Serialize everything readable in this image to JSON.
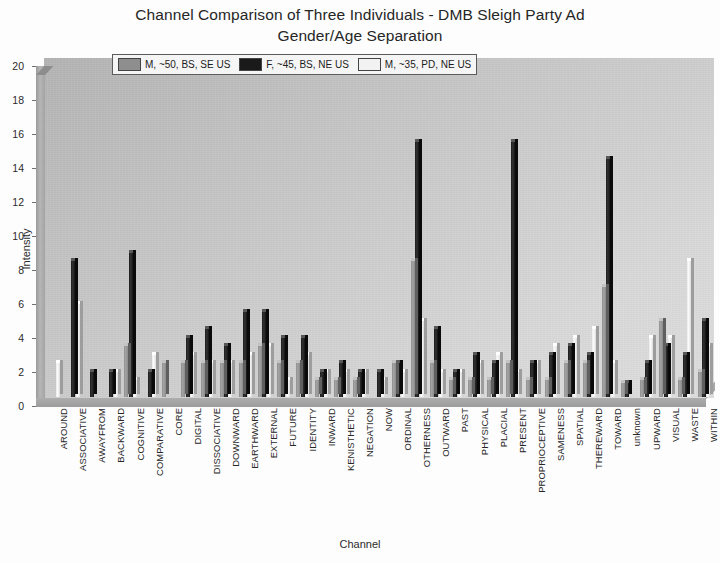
{
  "chart_data": {
    "type": "bar",
    "title": "Channel Comparison of Three Individuals - DMB Sleigh Party Ad\nGender/Age Separation",
    "title_line1": "Channel Comparison of Three Individuals - DMB Sleigh Party Ad",
    "title_line2": "Gender/Age Separation",
    "xlabel": "Channel",
    "ylabel": "Intensity",
    "ylim": [
      0,
      20
    ],
    "ytick_labels": [
      "0",
      "2",
      "4",
      "6",
      "8",
      "10",
      "12",
      "14",
      "16",
      "18",
      "20"
    ],
    "ytick_values": [
      0,
      2,
      4,
      6,
      8,
      10,
      12,
      14,
      16,
      18,
      20
    ],
    "grid": false,
    "legend_position": "top-center",
    "colors": {
      "series_0": "#8e8e8e",
      "series_1": "#1a1a1a",
      "series_2": "#efefef",
      "plot_background": "#cfcfcf",
      "page_background": "#fdfdfd",
      "text": "#262626"
    },
    "categories": [
      "AROUND",
      "ASSOCIATIVE",
      "AWAYFROM",
      "BACKWARD",
      "COGNITIVE",
      "COMPARATIVE",
      "CORE",
      "DIGITAL",
      "DISSOCIATIVE",
      "DOWNWARD",
      "EARTHWARD",
      "EXTERNAL",
      "FUTURE",
      "IDENTITY",
      "INWARD",
      "KENISTHETIC",
      "NEGATION",
      "NOW",
      "ORDINAL",
      "OTHERNESS",
      "OUTWARD",
      "PAST",
      "PHYSICAL",
      "PLACIAL",
      "PRESENT",
      "PROPRIOCEPTIVE",
      "SAMENESS",
      "SPATIAL",
      "THEREWARD",
      "TOWARD",
      "unknown",
      "UPWARD",
      "VISUAL",
      "WASTE",
      "WITHIN"
    ],
    "series": [
      {
        "name": "M, ~50, BS, SE US",
        "color": "#8e8e8e",
        "values": [
          0,
          0,
          0,
          0,
          3,
          0,
          2,
          2,
          2,
          2,
          2,
          3,
          2,
          2,
          1,
          1,
          1,
          0,
          2,
          8,
          2,
          1,
          1,
          1,
          2,
          1,
          1,
          2,
          2,
          6.5,
          0.8,
          1,
          4.5,
          1,
          1.5
        ]
      },
      {
        "name": "F, ~45, BS, NE US",
        "color": "#1a1a1a",
        "values": [
          0,
          8,
          1.5,
          1.5,
          8.5,
          1.5,
          0,
          3.5,
          4,
          3,
          5,
          5,
          3.5,
          3.5,
          1.5,
          2,
          1.5,
          1.5,
          2,
          15,
          4,
          1.5,
          2.5,
          2,
          15,
          2,
          2.5,
          3,
          2.5,
          14,
          0.8,
          2,
          3,
          2.5,
          4.5
        ]
      },
      {
        "name": "M, ~35, PD, NE US",
        "color": "#efefef",
        "values": [
          2,
          5.5,
          0,
          1.5,
          1,
          2.5,
          0,
          2.5,
          2,
          2,
          2.5,
          3,
          1,
          2.5,
          1.5,
          1.5,
          1.5,
          1,
          1.5,
          4.5,
          1.5,
          1.5,
          2,
          2.5,
          1.5,
          2,
          3,
          3.5,
          4,
          2,
          0,
          3.5,
          3.5,
          8,
          3
        ]
      }
    ]
  },
  "legend": {
    "entries": [
      {
        "label": "M, ~50, BS, SE US",
        "swatch": "#8e8e8e"
      },
      {
        "label": "F, ~45, BS, NE US",
        "swatch": "#1a1a1a"
      },
      {
        "label": "M, ~35, PD, NE US",
        "swatch": "#f2f2f2"
      }
    ]
  }
}
